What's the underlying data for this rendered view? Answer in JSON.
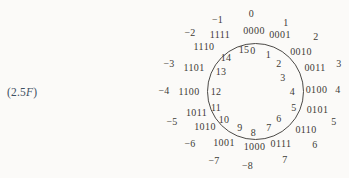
{
  "caption": {
    "prefix": "(2.5",
    "italic": "F",
    "suffix": ")"
  },
  "wheel": {
    "rings": {
      "inner_unsigned": [
        "0",
        "1",
        "2",
        "3",
        "4",
        "5",
        "6",
        "7",
        "8",
        "9",
        "10",
        "11",
        "12",
        "13",
        "14",
        "15"
      ],
      "binary": [
        "0000",
        "0001",
        "0010",
        "0011",
        "0100",
        "0101",
        "0110",
        "0111",
        "1000",
        "1001",
        "1010",
        "1011",
        "1100",
        "1101",
        "1110",
        "1111"
      ],
      "outer_signed": [
        "0",
        "1",
        "2",
        "3",
        "4",
        "5",
        "6",
        "7",
        "−8",
        "−7",
        "−6",
        "−5",
        "−4",
        "−3",
        "−2",
        "−1"
      ]
    }
  },
  "colors": {
    "background": "#fbfaf8",
    "text": "#3d3a36",
    "caption": "#3e5063",
    "circle_stroke": "#4c4a47"
  }
}
